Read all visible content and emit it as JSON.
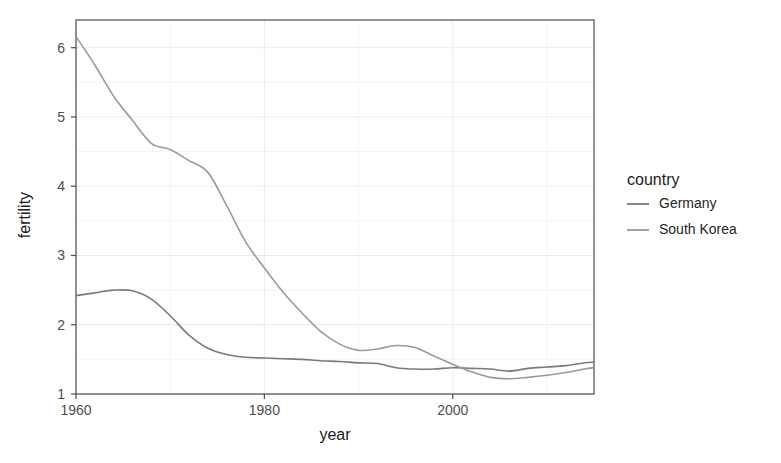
{
  "chart_data": {
    "type": "line",
    "title": "",
    "xlabel": "year",
    "ylabel": "fertility",
    "xlim": [
      1960,
      2015
    ],
    "ylim": [
      1,
      6.4
    ],
    "xticks": [
      1960,
      1980,
      2000
    ],
    "yticks": [
      1,
      2,
      3,
      4,
      5,
      6
    ],
    "xtick_labels": [
      "1960",
      "1980",
      "2000"
    ],
    "ytick_labels": [
      "1",
      "2",
      "3",
      "4",
      "5",
      "6"
    ],
    "grid": true,
    "legend_position": "right",
    "legend_title": "country",
    "series": [
      {
        "name": "Germany",
        "color": "#7a7a7a",
        "x": [
          1960,
          1962,
          1964,
          1966,
          1968,
          1970,
          1972,
          1974,
          1976,
          1978,
          1980,
          1982,
          1984,
          1986,
          1988,
          1990,
          1992,
          1994,
          1996,
          1998,
          2000,
          2002,
          2004,
          2006,
          2008,
          2010,
          2012,
          2014,
          2015
        ],
        "values": [
          2.42,
          2.46,
          2.5,
          2.49,
          2.37,
          2.13,
          1.85,
          1.66,
          1.57,
          1.53,
          1.52,
          1.51,
          1.5,
          1.48,
          1.47,
          1.45,
          1.44,
          1.38,
          1.36,
          1.36,
          1.38,
          1.37,
          1.36,
          1.33,
          1.37,
          1.39,
          1.41,
          1.45,
          1.46
        ]
      },
      {
        "name": "South Korea",
        "color": "#9a9a9a",
        "x": [
          1960,
          1962,
          1964,
          1966,
          1968,
          1970,
          1972,
          1974,
          1976,
          1978,
          1980,
          1982,
          1984,
          1986,
          1988,
          1990,
          1992,
          1994,
          1996,
          1998,
          2000,
          2002,
          2004,
          2006,
          2008,
          2010,
          2012,
          2014,
          2015
        ],
        "values": [
          6.16,
          5.75,
          5.3,
          4.95,
          4.62,
          4.53,
          4.37,
          4.2,
          3.72,
          3.2,
          2.82,
          2.47,
          2.17,
          1.9,
          1.72,
          1.63,
          1.65,
          1.7,
          1.67,
          1.55,
          1.43,
          1.32,
          1.24,
          1.22,
          1.24,
          1.27,
          1.31,
          1.36,
          1.38
        ]
      }
    ],
    "annotations": []
  },
  "axes": {
    "x_title": "year",
    "y_title": "fertility",
    "x_tick_labels": [
      "1960",
      "1980",
      "2000"
    ],
    "y_tick_labels": [
      "6",
      "5",
      "4",
      "3",
      "2",
      "1"
    ]
  },
  "legend": {
    "title": "country",
    "entries": [
      {
        "label": "Germany",
        "color": "#7a7a7a"
      },
      {
        "label": "South Korea",
        "color": "#9a9a9a"
      }
    ]
  },
  "style": {
    "panel_border": "#4d4d4d",
    "grid_major": "#ebebeb",
    "grid_minor": "#f4f4f4",
    "background": "#ffffff"
  }
}
